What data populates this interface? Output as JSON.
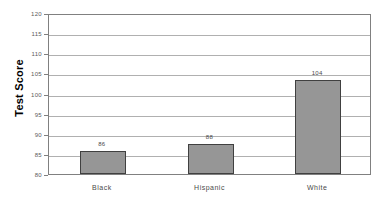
{
  "chart_data": {
    "type": "bar",
    "title": "",
    "subtitle": "",
    "xlabel": "",
    "ylabel": "Test Score",
    "categories": [
      "Black",
      "Hispanic",
      "White"
    ],
    "values": [
      86,
      88,
      104
    ],
    "bar_tops_actual": [
      85.8,
      87.5,
      103.3
    ],
    "data_labels": [
      "86",
      "88",
      "104"
    ],
    "ylim": [
      80,
      120
    ],
    "ytick_step": 5,
    "ytick_labels": [
      "120",
      "115",
      "110",
      "105",
      "100",
      "95",
      "90",
      "85",
      "80"
    ],
    "ytick_values": [
      120,
      115,
      110,
      105,
      100,
      95,
      90,
      85,
      80
    ],
    "grid": true,
    "grid_axis": "y",
    "legend": false,
    "legend_position": "none",
    "series": [
      {
        "name": "Test Score",
        "values": [
          86,
          88,
          104
        ]
      }
    ],
    "colors": {
      "bar_fill": "#969696",
      "bar_border": "#404040",
      "gridline": "#b0b0b0",
      "axis_border": "#808080",
      "plot_background": "#ffffff",
      "page_background": "#ffffff",
      "tick_label": "#5a5a5a",
      "category_label": "#4a4a4a",
      "value_label": "#4a4a4a",
      "axis_title": "#000000"
    }
  }
}
